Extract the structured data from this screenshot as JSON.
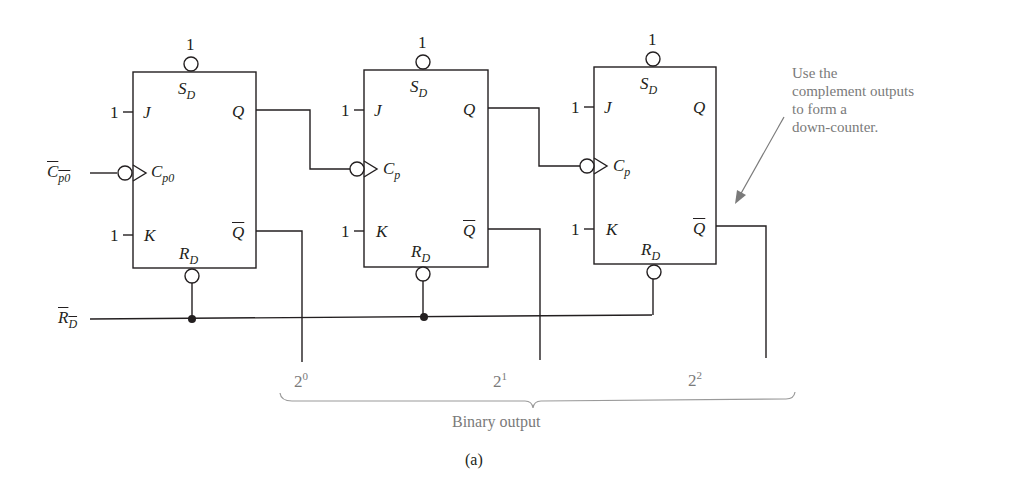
{
  "figure": {
    "caption": "(a)"
  },
  "inputs": {
    "clock_in": {
      "base": "C",
      "sub": "p0"
    },
    "reset_in": {
      "base": "R",
      "sub": "D"
    }
  },
  "flipflops": [
    {
      "sd_value": "1",
      "sd": {
        "base": "S",
        "sub": "D"
      },
      "j_value": "1",
      "j": "J",
      "k_value": "1",
      "k": "K",
      "clk": {
        "base": "C",
        "sub": "p0"
      },
      "q": "Q",
      "qbar": "Q",
      "rd": {
        "base": "R",
        "sub": "D"
      }
    },
    {
      "sd_value": "1",
      "sd": {
        "base": "S",
        "sub": "D"
      },
      "j_value": "1",
      "j": "J",
      "k_value": "1",
      "k": "K",
      "clk": {
        "base": "C",
        "sub": "p"
      },
      "q": "Q",
      "qbar": "Q",
      "rd": {
        "base": "R",
        "sub": "D"
      }
    },
    {
      "sd_value": "1",
      "sd": {
        "base": "S",
        "sub": "D"
      },
      "j_value": "1",
      "j": "J",
      "k_value": "1",
      "k": "K",
      "clk": {
        "base": "C",
        "sub": "p"
      },
      "q": "Q",
      "qbar": "Q",
      "rd": {
        "base": "R",
        "sub": "D"
      }
    }
  ],
  "outputs": [
    {
      "base": "2",
      "exp": "0"
    },
    {
      "base": "2",
      "exp": "1"
    },
    {
      "base": "2",
      "exp": "2"
    }
  ],
  "output_group_label": "Binary output",
  "annotation": {
    "lines": [
      "Use the",
      "complement outputs",
      "to form a",
      "down-counter."
    ]
  },
  "colors": {
    "line": "#231f20",
    "annotation": "#7a7a7a"
  }
}
